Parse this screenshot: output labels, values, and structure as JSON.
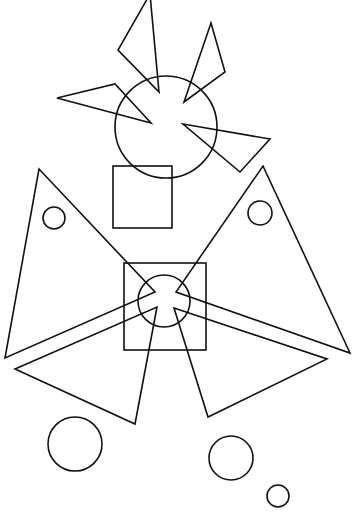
{
  "canvas": {
    "width": 356,
    "height": 519,
    "background": "#ffffff",
    "stroke": "#111111"
  },
  "shapes": {
    "triangles": [
      {
        "name": "top-left-triangle",
        "points": "150,-6 118,50 159,92"
      },
      {
        "name": "top-right-triangle",
        "points": "211,23 225,72 184,102"
      },
      {
        "name": "upper-left-triangle",
        "points": "57,98 115,84 151,123"
      },
      {
        "name": "upper-right-triangle",
        "points": "183,124 270,139 240,172"
      },
      {
        "name": "big-left-triangle",
        "points": "39,169 155,292 5,358"
      },
      {
        "name": "big-right-triangle",
        "points": "263,166 350,353 176,292"
      },
      {
        "name": "bottom-left-triangle",
        "points": "15,369 157,307 135,424"
      },
      {
        "name": "bottom-right-triangle",
        "points": "174,308 327,359 208,417"
      }
    ],
    "circles": [
      {
        "name": "upper-large-circle",
        "cx": 166,
        "cy": 127,
        "r": 51
      },
      {
        "name": "left-small-circle",
        "cx": 54,
        "cy": 218,
        "r": 11
      },
      {
        "name": "right-small-circle",
        "cx": 260,
        "cy": 213,
        "r": 12
      },
      {
        "name": "center-circle",
        "cx": 164,
        "cy": 301,
        "r": 26
      },
      {
        "name": "bottom-left-circle",
        "cx": 75,
        "cy": 444,
        "r": 27
      },
      {
        "name": "bottom-middle-circle",
        "cx": 231,
        "cy": 458,
        "r": 22
      },
      {
        "name": "bottom-right-small-circle",
        "cx": 278,
        "cy": 496,
        "r": 11
      }
    ],
    "rects": [
      {
        "name": "upper-square",
        "x": 113,
        "y": 166,
        "width": 59,
        "height": 62
      },
      {
        "name": "center-square",
        "x": 124,
        "y": 263,
        "width": 82,
        "height": 87
      }
    ]
  }
}
